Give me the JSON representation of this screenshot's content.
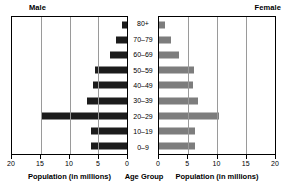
{
  "header": {
    "male_label": "Male",
    "female_label": "Female"
  },
  "captions": {
    "male_axis": "Population (in millions)",
    "age_axis": "Age Group",
    "female_axis": "Population (in millions)"
  },
  "axes": {
    "male_ticks": [
      "20",
      "15",
      "10",
      "5",
      "0"
    ],
    "female_ticks": [
      "0",
      "5",
      "10",
      "15",
      "20"
    ]
  },
  "colors": {
    "male_bar": "#1c1c1c",
    "female_bar": "#7d7d7d",
    "grid": "#9a9a9a",
    "axis": "#000000",
    "background": "#ffffff"
  },
  "chart_data": {
    "type": "bar",
    "title": "",
    "subtitle": "",
    "orientation": "horizontal-diverging",
    "chart_style": "population-pyramid",
    "categories": [
      "80+",
      "70–79",
      "60–69",
      "50–59",
      "40–49",
      "30–39",
      "20–29",
      "10–19",
      "0–9"
    ],
    "series": [
      {
        "name": "Male",
        "side": "left",
        "color": "#1c1c1c",
        "values": [
          0.8,
          2.0,
          3.0,
          5.5,
          6.0,
          7.0,
          15.0,
          6.2,
          6.2
        ],
        "xlabel": "Population (in millions)",
        "xlim": [
          20,
          0
        ],
        "ticks": [
          20,
          15,
          10,
          5,
          0
        ]
      },
      {
        "name": "Female",
        "side": "right",
        "color": "#7d7d7d",
        "values": [
          1.0,
          2.0,
          3.5,
          6.0,
          5.8,
          6.8,
          10.3,
          6.2,
          6.2
        ],
        "xlabel": "Population (in millions)",
        "xlim": [
          0,
          20
        ],
        "ticks": [
          0,
          5,
          10,
          15,
          20
        ]
      }
    ],
    "ylabel": "Age Group",
    "grid": true,
    "gridlines_at": [
      5,
      10,
      15
    ],
    "legend": "none",
    "legend_position": "top-corners",
    "units": "millions"
  }
}
